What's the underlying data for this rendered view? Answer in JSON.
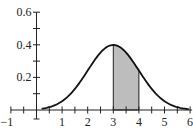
{
  "chart_data": {
    "type": "area",
    "title": "",
    "xlabel": "",
    "ylabel": "",
    "xlim": [
      -1,
      6
    ],
    "ylim": [
      0,
      0.6
    ],
    "grid": false,
    "x_ticks": [
      -1,
      1,
      2,
      3,
      4,
      5,
      6
    ],
    "x_tick_labels": [
      "−1",
      "1",
      "2",
      "3",
      "4",
      "5",
      "6"
    ],
    "x_minor_step": 0.5,
    "y_ticks": [
      0.2,
      0.4,
      0.6
    ],
    "y_tick_labels": [
      "0.2",
      "0.4",
      "0.6"
    ],
    "y_minor_step": 0.1,
    "series": [
      {
        "name": "normal density",
        "mean": 3,
        "sd": 1,
        "x": [
          0,
          0.5,
          1,
          1.5,
          2,
          2.5,
          3,
          3.5,
          4,
          4.5,
          5,
          5.5,
          6
        ],
        "y": [
          0.004,
          0.018,
          0.054,
          0.13,
          0.242,
          0.352,
          0.399,
          0.352,
          0.242,
          0.13,
          0.054,
          0.018,
          0.004
        ]
      }
    ],
    "shaded_region": {
      "from": 3,
      "to": 4,
      "color": "#bdbdbd"
    },
    "line_color": "#111111"
  }
}
